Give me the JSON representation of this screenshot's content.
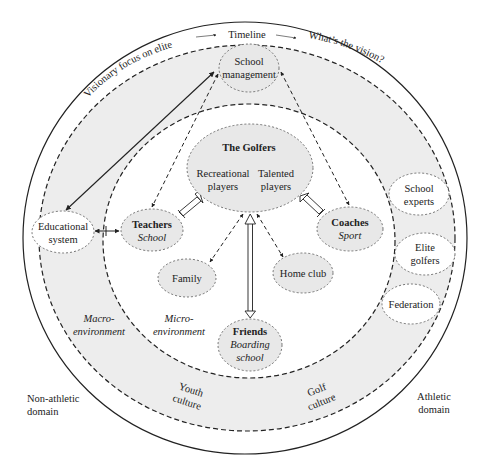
{
  "diagram": {
    "type": "nested-ellipse ecological model",
    "colors": {
      "ring_fill": "#ededed",
      "node_fill": "#e8e8e8",
      "line": "#222222",
      "background": "#ffffff"
    },
    "arc_labels": {
      "left": "Visionary focus on elite",
      "top": "Timeline",
      "right": "What’s the vision?"
    },
    "region_labels": {
      "macro_1": "Macro-",
      "macro_2": "environment",
      "micro_1": "Micro-",
      "micro_2": "environment",
      "youth_1": "Youth",
      "youth_2": "culture",
      "golf_1": "Golf",
      "golf_2": "culture",
      "non_athletic_1": "Non-athletic",
      "non_athletic_2": "domain",
      "athletic_1": "Athletic",
      "athletic_2": "domain"
    },
    "nodes": {
      "school_management": {
        "line1": "School",
        "line2": "management"
      },
      "golfers": {
        "title": "The Golfers",
        "left_1": "Recreational",
        "left_2": "players",
        "right_1": "Talented",
        "right_2": "players"
      },
      "teachers": {
        "title": "Teachers",
        "subtitle": "School"
      },
      "coaches": {
        "title": "Coaches",
        "subtitle": "Sport"
      },
      "educational_system": {
        "line1": "Educational",
        "line2": "system"
      },
      "family": {
        "label": "Family"
      },
      "home_club": {
        "label": "Home club"
      },
      "friends": {
        "title": "Friends",
        "sub1": "Boarding",
        "sub2": "school"
      },
      "school_experts": {
        "line1": "School",
        "line2": "experts"
      },
      "elite_golfers": {
        "line1": "Elite",
        "line2": "golfers"
      },
      "federation": {
        "label": "Federation"
      }
    },
    "edges": [
      {
        "from": "Educational system",
        "to": "School management",
        "style": "solid",
        "direction": "both"
      },
      {
        "from": "Educational system",
        "to": "Teachers",
        "style": "solid",
        "direction": "both"
      },
      {
        "from": "School management",
        "to": "Teachers",
        "style": "dashed",
        "direction": "both"
      },
      {
        "from": "School management",
        "to": "Coaches",
        "style": "dashed",
        "direction": "both"
      },
      {
        "from": "The Golfers",
        "to": "Teachers",
        "style": "hollow-double",
        "direction": "both"
      },
      {
        "from": "The Golfers",
        "to": "Coaches",
        "style": "hollow-double",
        "direction": "both"
      },
      {
        "from": "The Golfers",
        "to": "Friends",
        "style": "hollow-double",
        "direction": "both"
      },
      {
        "from": "The Golfers",
        "to": "Family",
        "style": "dashed",
        "direction": "both"
      },
      {
        "from": "The Golfers",
        "to": "Home club",
        "style": "dashed",
        "direction": "both"
      }
    ]
  }
}
